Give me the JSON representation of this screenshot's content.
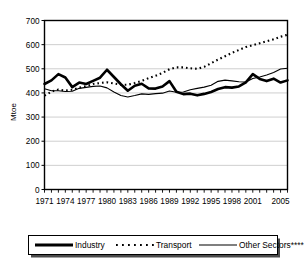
{
  "chart_data": {
    "type": "line",
    "title": "",
    "xlabel": "",
    "ylabel": "Mtoe",
    "ylim": [
      0,
      700
    ],
    "ytick_labels": [
      "0",
      "100",
      "200",
      "300",
      "400",
      "500",
      "600",
      "700"
    ],
    "yticks": [
      0,
      100,
      200,
      300,
      400,
      500,
      600,
      700
    ],
    "grid": "horizontal",
    "legend_position": "bottom",
    "x": [
      1971,
      1972,
      1973,
      1974,
      1975,
      1976,
      1977,
      1978,
      1979,
      1980,
      1981,
      1982,
      1983,
      1984,
      1985,
      1986,
      1987,
      1988,
      1989,
      1990,
      1991,
      1992,
      1993,
      1994,
      1995,
      1996,
      1997,
      1998,
      1999,
      2000,
      2001,
      2002,
      2003,
      2004,
      2005,
      2006
    ],
    "xtick_labels": [
      "1971",
      "1974",
      "1977",
      "1980",
      "1983",
      "1986",
      "1989",
      "1992",
      "1995",
      "1998",
      "2001",
      "2005"
    ],
    "xticks": [
      1971,
      1974,
      1977,
      1980,
      1983,
      1986,
      1989,
      1992,
      1995,
      1998,
      2001,
      2005
    ],
    "series": [
      {
        "name": "Industry",
        "style": "thick-solid",
        "color": "#000000",
        "values": [
          437,
          452,
          478,
          464,
          424,
          443,
          437,
          450,
          463,
          496,
          466,
          436,
          409,
          430,
          438,
          419,
          418,
          427,
          449,
          405,
          395,
          397,
          390,
          396,
          404,
          416,
          424,
          422,
          427,
          444,
          478,
          458,
          449,
          459,
          443,
          452
        ]
      },
      {
        "name": "Transport",
        "style": "dotted",
        "color": "#000000",
        "values": [
          389,
          405,
          414,
          410,
          413,
          422,
          428,
          437,
          441,
          444,
          439,
          434,
          434,
          441,
          450,
          461,
          471,
          483,
          498,
          506,
          506,
          502,
          500,
          508,
          523,
          538,
          552,
          566,
          578,
          590,
          598,
          606,
          614,
          622,
          633,
          641
        ]
      },
      {
        "name": "Other Sectors****",
        "style": "thin-solid",
        "color": "#000000",
        "values": [
          417,
          409,
          409,
          406,
          407,
          419,
          423,
          427,
          429,
          421,
          404,
          389,
          383,
          389,
          396,
          394,
          397,
          399,
          408,
          403,
          404,
          413,
          419,
          424,
          432,
          448,
          453,
          450,
          446,
          445,
          460,
          466,
          474,
          485,
          499,
          502
        ]
      }
    ]
  },
  "legend": {
    "items": [
      {
        "label": "Industry",
        "style": "thick-solid"
      },
      {
        "label": "Transport",
        "style": "dotted"
      },
      {
        "label": "Other Sectors****",
        "style": "thin-solid"
      }
    ]
  },
  "axis": {
    "y_title": "Mtoe"
  }
}
